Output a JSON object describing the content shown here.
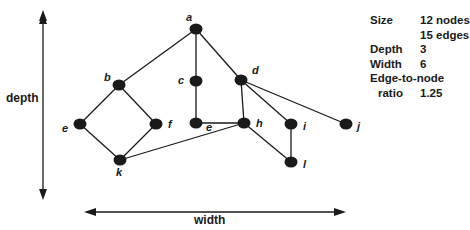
{
  "axes": {
    "vertical_label": "depth",
    "horizontal_label": "width"
  },
  "nodes": [
    {
      "id": "a",
      "label": "a",
      "x": 196,
      "y": 29,
      "lx": 186,
      "ly": 21
    },
    {
      "id": "b",
      "label": "b",
      "x": 119,
      "y": 85,
      "lx": 104,
      "ly": 81
    },
    {
      "id": "c",
      "label": "c",
      "x": 196,
      "y": 81,
      "lx": 178,
      "ly": 84
    },
    {
      "id": "d",
      "label": "d",
      "x": 241,
      "y": 80,
      "lx": 252,
      "ly": 74
    },
    {
      "id": "e1",
      "label": "e",
      "x": 80,
      "y": 124,
      "lx": 62,
      "ly": 132
    },
    {
      "id": "f",
      "label": "f",
      "x": 156,
      "y": 124,
      "lx": 168,
      "ly": 128
    },
    {
      "id": "e2",
      "label": "e",
      "x": 196,
      "y": 123,
      "lx": 206,
      "ly": 131
    },
    {
      "id": "h",
      "label": "h",
      "x": 244,
      "y": 123,
      "lx": 256,
      "ly": 127
    },
    {
      "id": "i",
      "label": "i",
      "x": 291,
      "y": 124,
      "lx": 303,
      "ly": 130
    },
    {
      "id": "j",
      "label": "j",
      "x": 346,
      "y": 124,
      "lx": 357,
      "ly": 130
    },
    {
      "id": "k",
      "label": "k",
      "x": 120,
      "y": 160,
      "lx": 116,
      "ly": 176
    },
    {
      "id": "l",
      "label": "l",
      "x": 291,
      "y": 162,
      "lx": 303,
      "ly": 168
    }
  ],
  "edges": [
    [
      "a",
      "b"
    ],
    [
      "a",
      "c"
    ],
    [
      "a",
      "d"
    ],
    [
      "b",
      "e1"
    ],
    [
      "b",
      "f"
    ],
    [
      "e1",
      "k"
    ],
    [
      "f",
      "k"
    ],
    [
      "k",
      "h"
    ],
    [
      "c",
      "e2"
    ],
    [
      "e2",
      "h"
    ],
    [
      "d",
      "h"
    ],
    [
      "d",
      "i"
    ],
    [
      "d",
      "j"
    ],
    [
      "h",
      "l"
    ],
    [
      "i",
      "l"
    ]
  ],
  "stats": {
    "size_label": "Size",
    "size_nodes": "12 nodes",
    "size_edges": "15 edges",
    "depth_label": "Depth",
    "depth_value": "3",
    "width_label": "Width",
    "width_value": "6",
    "ratio_label_1": "Edge-to-node",
    "ratio_label_2": "ratio",
    "ratio_value": "1.25"
  },
  "colors": {
    "ink": "#1a1a1a",
    "background": "#ffffff"
  }
}
